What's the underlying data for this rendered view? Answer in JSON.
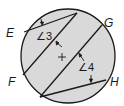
{
  "diagram": {
    "type": "circle with parallel chords",
    "points": {
      "E": "E",
      "F": "F",
      "G": "G",
      "H": "H"
    },
    "angles": {
      "angle3": "∠3",
      "angle4": "∠4"
    },
    "colors": {
      "fill": "#d9d9d9",
      "stroke": "#1a1a1a"
    }
  }
}
